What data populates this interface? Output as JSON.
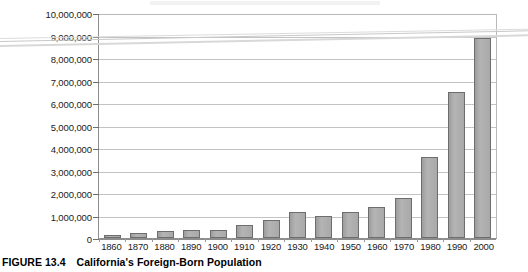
{
  "caption": {
    "figure_number": "FIGURE 13.4",
    "title": "California's Foreign-Born Population"
  },
  "colors": {
    "bar_fill": "#a8a8a8",
    "bar_border": "#6d6d6d",
    "gridline": "#c3c3c3",
    "axis": "#8d8d8d",
    "text": "#1b1b1b"
  },
  "chart_data": {
    "type": "bar",
    "title": "California's Foreign-Born Population",
    "xlabel": "",
    "ylabel": "",
    "ylim": [
      0,
      10000000
    ],
    "ytick_labels": [
      "10,000,000",
      "9,000,000",
      "8,000,000",
      "7,000,000",
      "6,000,000",
      "5,000,000",
      "4,000,000",
      "3,000,000",
      "2,000,000",
      "1,000,000",
      "0"
    ],
    "ytick_values": [
      10000000,
      9000000,
      8000000,
      7000000,
      6000000,
      5000000,
      4000000,
      3000000,
      2000000,
      1000000,
      0
    ],
    "grid": true,
    "legend": false,
    "categories": [
      "1860",
      "1870",
      "1880",
      "1890",
      "1900",
      "1910",
      "1920",
      "1930",
      "1940",
      "1950",
      "1960",
      "1970",
      "1980",
      "1990",
      "2000"
    ],
    "values": [
      150000,
      220000,
      290000,
      370000,
      370000,
      580000,
      800000,
      1150000,
      1000000,
      1150000,
      1400000,
      1800000,
      3600000,
      6500000,
      8900000
    ]
  }
}
